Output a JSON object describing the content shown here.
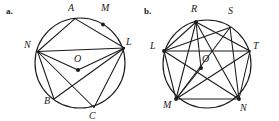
{
  "figure": {
    "background_color": "#ffffff",
    "ink_color": "#1a1a1a",
    "panels": [
      {
        "tag": "a.",
        "tag_pos": {
          "x": 6,
          "y": 14
        },
        "circle": {
          "cx": 80,
          "cy": 63,
          "r": 45
        },
        "center_label": "O",
        "center_label_pos": {
          "x": 74,
          "y": 62
        },
        "center_point": {
          "x": 78,
          "y": 70
        },
        "points": [
          {
            "name": "A",
            "x": 75,
            "y": 18.6,
            "label_x": 68,
            "label_y": 11,
            "dot": false
          },
          {
            "name": "M",
            "x": 103,
            "y": 24.5,
            "label_x": 101,
            "label_y": 11,
            "dot": true
          },
          {
            "name": "N",
            "x": 37.5,
            "y": 51.5,
            "label_x": 24,
            "label_y": 48,
            "dot": false
          },
          {
            "name": "L",
            "x": 124.5,
            "y": 48,
            "label_x": 126,
            "label_y": 45,
            "dot": false
          },
          {
            "name": "B",
            "x": 54,
            "y": 99,
            "label_x": 44,
            "label_y": 104,
            "dot": false
          },
          {
            "name": "C",
            "x": 94,
            "y": 107.5,
            "label_x": 89,
            "label_y": 119,
            "dot": false
          }
        ],
        "chords": [
          [
            "A",
            "N"
          ],
          [
            "A",
            "L"
          ],
          [
            "N",
            "L"
          ],
          [
            "N",
            "O"
          ],
          [
            "L",
            "O"
          ],
          [
            "N",
            "B"
          ],
          [
            "N",
            "C"
          ],
          [
            "L",
            "B"
          ],
          [
            "L",
            "C"
          ]
        ]
      },
      {
        "tag": "b.",
        "tag_pos": {
          "x": 144,
          "y": 14
        },
        "circle": {
          "cx": 207,
          "cy": 64,
          "r": 44
        },
        "center_label": "O",
        "center_label_pos": {
          "x": 202,
          "y": 62
        },
        "center_point": {
          "x": 201,
          "y": 68
        },
        "points": [
          {
            "name": "R",
            "x": 196,
            "y": 22,
            "label_x": 191,
            "label_y": 12,
            "dot": true
          },
          {
            "name": "S",
            "x": 230,
            "y": 27.5,
            "label_x": 228,
            "label_y": 14,
            "dot": false
          },
          {
            "name": "L",
            "x": 164,
            "y": 51,
            "label_x": 150,
            "label_y": 49,
            "dot": true
          },
          {
            "name": "T",
            "x": 250,
            "y": 51,
            "label_x": 253,
            "label_y": 49,
            "dot": false
          },
          {
            "name": "M",
            "x": 176,
            "y": 99,
            "label_x": 163,
            "label_y": 108,
            "dot": true
          },
          {
            "name": "N",
            "x": 239,
            "y": 99,
            "label_x": 240,
            "label_y": 111,
            "dot": true
          }
        ],
        "chords": [
          [
            "L",
            "R"
          ],
          [
            "L",
            "S"
          ],
          [
            "L",
            "T"
          ],
          [
            "L",
            "N"
          ],
          [
            "L",
            "M"
          ],
          [
            "R",
            "M"
          ],
          [
            "R",
            "N"
          ],
          [
            "R",
            "T"
          ],
          [
            "S",
            "N"
          ],
          [
            "S",
            "M"
          ],
          [
            "M",
            "N"
          ],
          [
            "M",
            "T"
          ],
          [
            "T",
            "N"
          ],
          [
            "M",
            "O"
          ],
          [
            "R",
            "O"
          ]
        ]
      }
    ]
  }
}
